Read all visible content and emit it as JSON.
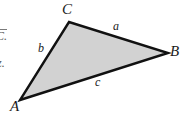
{
  "figure": {
    "background_color": "#ffffff",
    "triangle": {
      "fill_color": "#d2d2d2",
      "stroke_color": "#111111",
      "stroke_width": 2.4,
      "vertices": [
        {
          "name": "A",
          "label": "A",
          "x": 20,
          "y": 100
        },
        {
          "name": "B",
          "label": "B",
          "x": 168,
          "y": 53
        },
        {
          "name": "C",
          "label": "C",
          "x": 69,
          "y": 22
        }
      ],
      "sides": [
        {
          "name": "a",
          "label": "a",
          "between": "C-B"
        },
        {
          "name": "b",
          "label": "b",
          "between": "A-C"
        },
        {
          "name": "c",
          "label": "c",
          "between": "A-B"
        }
      ]
    },
    "margin_fragments": [
      {
        "name": "fragment-top",
        "text": "C."
      },
      {
        "name": "fragment-bottom",
        "text": "z."
      }
    ]
  }
}
